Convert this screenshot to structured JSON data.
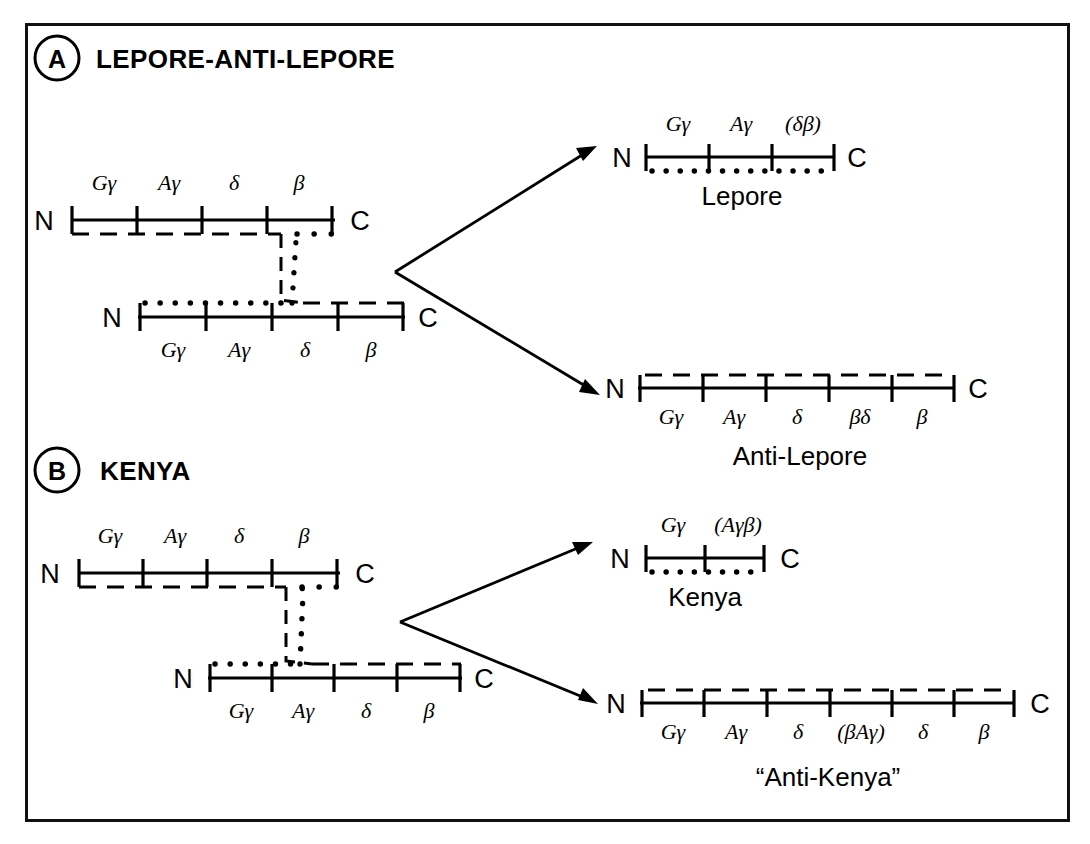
{
  "figure": {
    "background": "#ffffff",
    "line_color": "#000000",
    "border_color": "#111111",
    "terminus_left": "N",
    "terminus_right": "C"
  },
  "panels": [
    {
      "id": "A",
      "badge": "A",
      "title": "LEPORE-ANTI-LEPORE",
      "parents": [
        {
          "name": "parent-chromosome-upper",
          "labels_position": "above",
          "genes": [
            "Gγ",
            "Aγ",
            "δ",
            "β"
          ],
          "trace": "dashed"
        },
        {
          "name": "parent-chromosome-lower",
          "labels_position": "below",
          "genes": [
            "Gγ",
            "Aγ",
            "δ",
            "β"
          ],
          "trace": "dotted"
        }
      ],
      "products": [
        {
          "name": "Lepore",
          "label": "Lepore",
          "genes": [
            "Gγ",
            "Aγ",
            "(δβ)"
          ],
          "labels_position": "above",
          "trace": "dotted"
        },
        {
          "name": "Anti-Lepore",
          "label": "Anti-Lepore",
          "genes": [
            "Gγ",
            "Aγ",
            "δ",
            "βδ",
            "β"
          ],
          "labels_position": "below",
          "trace": "dashed"
        }
      ]
    },
    {
      "id": "B",
      "badge": "B",
      "title": "KENYA",
      "parents": [
        {
          "name": "parent-chromosome-upper",
          "labels_position": "above",
          "genes": [
            "Gγ",
            "Aγ",
            "δ",
            "β"
          ],
          "trace": "dashed"
        },
        {
          "name": "parent-chromosome-lower",
          "labels_position": "below",
          "genes": [
            "Gγ",
            "Aγ",
            "δ",
            "β"
          ],
          "trace": "dotted"
        }
      ],
      "products": [
        {
          "name": "Kenya",
          "label": "Kenya",
          "genes": [
            "Gγ",
            "(Aγβ)"
          ],
          "labels_position": "above",
          "trace": "dotted"
        },
        {
          "name": "Anti-Kenya",
          "label": "“Anti-Kenya”",
          "genes": [
            "Gγ",
            "Aγ",
            "δ",
            "(βAγ)",
            "δ",
            "β"
          ],
          "labels_position": "below",
          "trace": "dashed"
        }
      ]
    }
  ]
}
